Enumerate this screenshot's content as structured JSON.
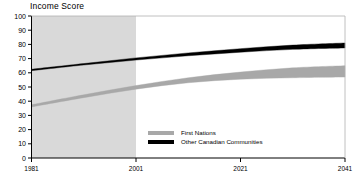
{
  "chart_data": {
    "type": "area",
    "title": "Income Score",
    "xlabel": "",
    "ylabel": "Income Score",
    "xlim": [
      1981,
      2041
    ],
    "ylim": [
      0,
      100
    ],
    "xticks": [
      1981,
      2001,
      2021,
      2041
    ],
    "yticks": [
      0,
      10,
      20,
      30,
      40,
      50,
      60,
      70,
      80,
      90,
      100
    ],
    "grid": false,
    "legend_position": "center",
    "shaded_region": {
      "label": "historical",
      "x_start": 1981,
      "x_end": 2001,
      "color": "#d9d9d9"
    },
    "series": [
      {
        "name": "First Nations",
        "color": "#a8a8a8",
        "band": true,
        "x": [
          1981,
          1991,
          2001,
          2011,
          2021,
          2031,
          2041
        ],
        "lower": [
          36.0,
          42.5,
          48.5,
          53.0,
          55.5,
          56.5,
          57.0
        ],
        "upper": [
          37.5,
          44.5,
          51.0,
          56.5,
          60.5,
          63.5,
          65.0
        ]
      },
      {
        "name": "Other Canadian Communities",
        "color": "#000000",
        "band": true,
        "x": [
          1981,
          1991,
          2001,
          2011,
          2021,
          2031,
          2041
        ],
        "lower": [
          61.5,
          65.5,
          69.0,
          72.0,
          74.5,
          76.5,
          77.5
        ],
        "upper": [
          62.5,
          66.5,
          70.5,
          74.0,
          77.0,
          79.5,
          81.0
        ]
      }
    ]
  },
  "legend": {
    "items": [
      {
        "label": "First Nations",
        "color": "#a8a8a8"
      },
      {
        "label": "Other Canadian Communities",
        "color": "#000000"
      }
    ]
  },
  "axis": {
    "y_labels": [
      "100",
      "90",
      "80",
      "70",
      "60",
      "50",
      "40",
      "30",
      "20",
      "10",
      "0"
    ],
    "x_labels": [
      "1981",
      "2001",
      "2021",
      "2041"
    ]
  }
}
